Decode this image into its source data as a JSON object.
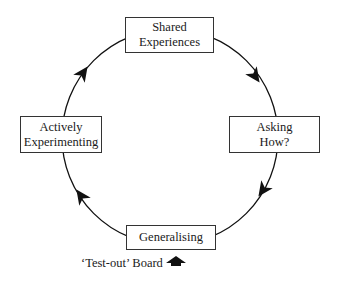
{
  "diagram": {
    "type": "cycle",
    "direction": "clockwise",
    "nodes": [
      {
        "id": "shared",
        "label": "Shared\nExperiences"
      },
      {
        "id": "asking",
        "label": "Asking\nHow?"
      },
      {
        "id": "generalising",
        "label": "Generalising"
      },
      {
        "id": "actively",
        "label": "Actively\nExperimenting"
      }
    ],
    "edges": [
      {
        "from": "shared",
        "to": "asking"
      },
      {
        "from": "asking",
        "to": "generalising"
      },
      {
        "from": "generalising",
        "to": "actively"
      },
      {
        "from": "actively",
        "to": "shared"
      }
    ],
    "annotation": {
      "label": "‘Test-out’ Board",
      "icon": "up-arrow-icon",
      "points_to": "generalising"
    }
  },
  "colors": {
    "line": "#111111",
    "box_border": "#333333",
    "background": "#ffffff"
  }
}
